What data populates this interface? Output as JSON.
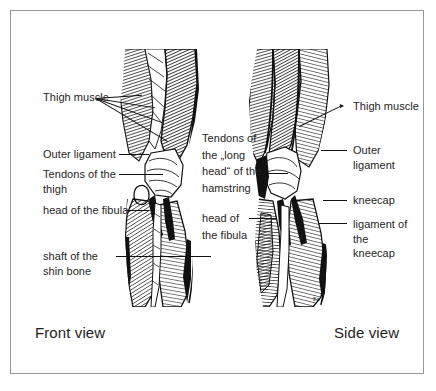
{
  "figure": {
    "title_visible": false,
    "border_color": "#9a9a9a",
    "background": "#ffffff",
    "ink_color": "#111111",
    "text_color": "#252525"
  },
  "captions": {
    "left": "Front view",
    "right": "Side view"
  },
  "labels": {
    "left_column": [
      {
        "id": "thigh-muscle-left",
        "text": "Thigh muscle"
      },
      {
        "id": "outer-ligament-left",
        "text": "Outer ligament"
      },
      {
        "id": "tendons-of-the-thigh",
        "text": "Tendons of the\nthigh"
      },
      {
        "id": "head-of-the-fibula-left",
        "text": "head of the fibula"
      },
      {
        "id": "shaft-of-the-shin-bone",
        "text": "shaft of the\nshin bone"
      }
    ],
    "center_column": [
      {
        "id": "tendons-long-head-hamstring",
        "text": "Tendons of\nthe „long\nhead“ of the\nhamstring"
      },
      {
        "id": "head-of-the-fibula-center",
        "text": "head of\nthe fibula"
      }
    ],
    "right_column": [
      {
        "id": "thigh-muscle-right",
        "text": "Thigh muscle"
      },
      {
        "id": "outer-ligament-right",
        "text": "Outer ligament"
      },
      {
        "id": "kneecap",
        "text": "kneecap"
      },
      {
        "id": "ligament-of-the-kneecap",
        "text": "ligament of the\nkneecap"
      }
    ]
  },
  "illustrations": [
    {
      "id": "front-view-leg",
      "view": "Front view",
      "subject": "human knee and leg anatomy, muscles and ligaments"
    },
    {
      "id": "side-view-leg",
      "view": "Side view",
      "subject": "human knee and leg anatomy, muscles and ligaments"
    }
  ]
}
